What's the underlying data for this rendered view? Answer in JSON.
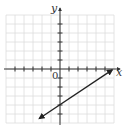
{
  "chart_data": {
    "type": "line",
    "title": "",
    "xlabel": "x",
    "ylabel": "y",
    "origin_label": "0",
    "xlim": [
      -6,
      6
    ],
    "ylim": [
      -6,
      6
    ],
    "grid": true,
    "tick_step": 1,
    "series": [
      {
        "name": "line",
        "equation": "y = (2/3)x - 4",
        "slope": 0.6667,
        "intercept": -4,
        "x": [
          -2.3,
          5.8
        ],
        "y": [
          -5.5,
          -0.1
        ],
        "arrows": "both"
      }
    ]
  },
  "layout": {
    "origin_px": [
      60,
      69
    ],
    "unit_px": 9,
    "grid_color": "#dddddd",
    "axis_color": "#333333",
    "line_color": "#222222"
  }
}
